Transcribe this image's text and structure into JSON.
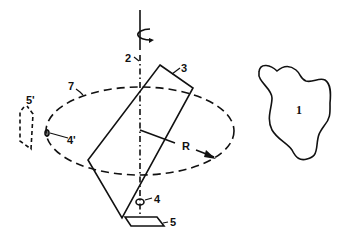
{
  "diagram": {
    "type": "technical-patent-figure",
    "labels": {
      "object": "1",
      "axis": "2",
      "plate": "3",
      "pivot": "4",
      "pivot_image": "4'",
      "base": "5",
      "base_image": "5'",
      "orbit": "7",
      "radius": "R"
    },
    "colors": {
      "stroke": "#111111",
      "background": "#ffffff"
    }
  }
}
